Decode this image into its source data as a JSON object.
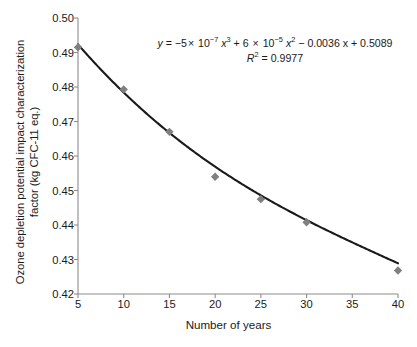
{
  "chart_data": {
    "type": "scatter",
    "title": "",
    "xlabel": "Number of years",
    "ylabel_line1": "Ozone depletion potential impact characterization",
    "ylabel_line2": "factor (kg CFC-11 eq.)",
    "x": [
      5,
      10,
      15,
      20,
      25,
      30,
      40
    ],
    "values": [
      0.4915,
      0.4793,
      0.467,
      0.454,
      0.4475,
      0.4408,
      0.4268
    ],
    "series": [
      {
        "name": "Ozone depletion potential impact characterization factor",
        "marker": "diamond",
        "marker_color": "#808080",
        "x": [
          5,
          10,
          15,
          20,
          25,
          30,
          40
        ],
        "values": [
          0.4915,
          0.4793,
          0.467,
          0.454,
          0.4475,
          0.4408,
          0.4268
        ]
      }
    ],
    "trendline": {
      "type": "polynomial",
      "order": 3,
      "color": "#1a1a1a",
      "coefficients": [
        -5e-07,
        6e-05,
        -0.0036,
        0.5089
      ],
      "r_squared": 0.9977
    },
    "xlim": [
      5,
      40
    ],
    "ylim": [
      0.42,
      0.5
    ],
    "xticks": [
      "5",
      "10",
      "15",
      "20",
      "25",
      "30",
      "35",
      "40"
    ],
    "xtick_values": [
      5,
      10,
      15,
      20,
      25,
      30,
      35,
      40
    ],
    "yticks": [
      "0.42",
      "0.43",
      "0.44",
      "0.45",
      "0.46",
      "0.47",
      "0.48",
      "0.49",
      "0.50"
    ],
    "ytick_values": [
      0.42,
      0.43,
      0.44,
      0.45,
      0.46,
      0.47,
      0.48,
      0.49,
      0.5
    ],
    "grid": false,
    "legend": "none"
  },
  "annotation": {
    "equation_prefix": "y",
    "equation_eq": " = −5",
    "equation_times1": "×",
    "equation_base1": " 10",
    "equation_exp1": "−7",
    "equation_x1": " x",
    "equation_x1exp": "3",
    "equation_plus": " + 6 ",
    "equation_times2": "×",
    "equation_base2": " 10",
    "equation_exp2": "−5",
    "equation_x2": " x",
    "equation_x2exp": "2",
    "equation_tail": " − 0.0036 x + 0.5089",
    "r2_label": "R",
    "r2_sup": "2",
    "r2_value": " = 0.9977",
    "equation_plain": "y = −5 × 10⁻⁷ x³ + 6 × 10⁻⁵ x² − 0.0036 x + 0.5089",
    "r2_plain": "R² = 0.9977"
  },
  "colors": {
    "axis": "#8c8c8c",
    "marker": "#808080",
    "curve": "#1a1a1a",
    "text": "#1a1a1a",
    "background": "#ffffff"
  }
}
